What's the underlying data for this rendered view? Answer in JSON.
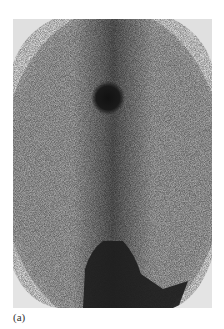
{
  "figure": {
    "caption": "(a)",
    "colors": {
      "background": "#d9d9d9",
      "noise_dark": "#4a4a4a",
      "hot_spot": "#1a1a1a",
      "page": "#ffffff"
    }
  }
}
